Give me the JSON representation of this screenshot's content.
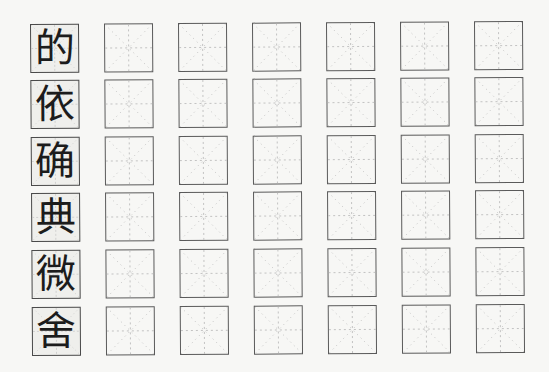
{
  "worksheet": {
    "type": "calligraphy-practice-grid",
    "grid_style": "mi-zi-ge",
    "columns": 7,
    "rows": [
      {
        "model_char": "的",
        "practice_cells": 6
      },
      {
        "model_char": "依",
        "practice_cells": 6
      },
      {
        "model_char": "确",
        "practice_cells": 6
      },
      {
        "model_char": "典",
        "practice_cells": 6
      },
      {
        "model_char": "微",
        "practice_cells": 6
      },
      {
        "model_char": "舍",
        "practice_cells": 6
      }
    ],
    "colors": {
      "paper": "#f7f7f5",
      "border": "#5a5a5a",
      "guide_lines": "#b5b5b5",
      "ink": "#1c1c1c"
    }
  }
}
